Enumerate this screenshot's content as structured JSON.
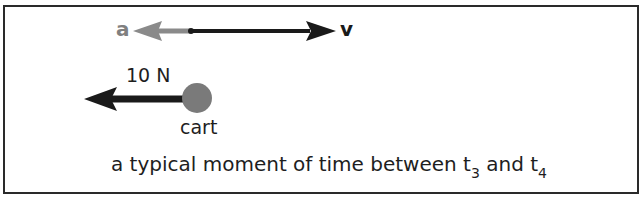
{
  "diagram": {
    "type": "motion diagram",
    "vectors": [
      {
        "label": "a",
        "direction": "left",
        "color": "#808080"
      },
      {
        "label": "v",
        "direction": "right",
        "color": "#1a1a1a"
      }
    ],
    "force": {
      "label": "10 N",
      "direction": "left",
      "color": "#1a1a1a"
    },
    "object": {
      "label": "cart",
      "color": "#7a7a7a"
    },
    "caption": {
      "prefix": "a typical moment of time between t",
      "sub1": "3",
      "middle": " and t",
      "sub2": "4"
    }
  }
}
